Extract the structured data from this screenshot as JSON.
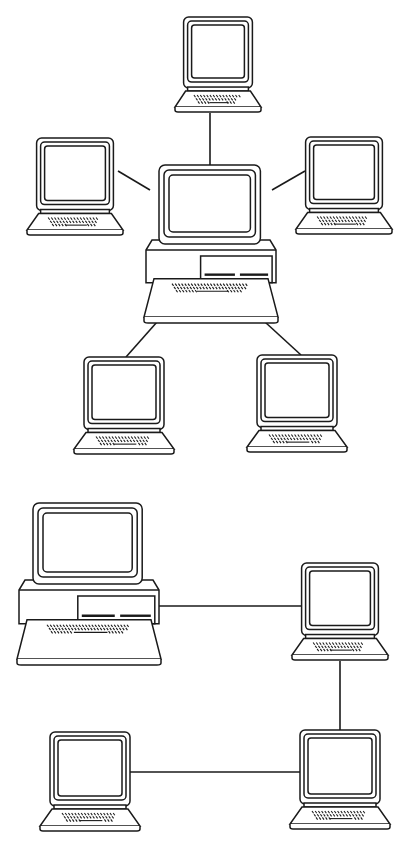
{
  "diagrams": [
    {
      "name": "star-topology",
      "hub": {
        "type": "desktop-with-base-unit",
        "x": 146,
        "y": 165,
        "w": 130,
        "h": 158
      },
      "nodes": [
        {
          "id": "top",
          "type": "terminal",
          "x": 175,
          "y": 17,
          "w": 86,
          "h": 96
        },
        {
          "id": "left",
          "type": "terminal",
          "x": 27,
          "y": 138,
          "w": 96,
          "h": 98
        },
        {
          "id": "right",
          "type": "terminal",
          "x": 296,
          "y": 137,
          "w": 96,
          "h": 98
        },
        {
          "id": "bottom-left",
          "type": "terminal",
          "x": 74,
          "y": 357,
          "w": 100,
          "h": 98
        },
        {
          "id": "bottom-right",
          "type": "terminal",
          "x": 247,
          "y": 355,
          "w": 100,
          "h": 98
        }
      ],
      "links": [
        {
          "from": "top",
          "to": "hub",
          "x1": 210,
          "y1": 113,
          "x2": 210,
          "y2": 165
        },
        {
          "from": "left",
          "to": "hub",
          "x1": 118,
          "y1": 171,
          "x2": 150,
          "y2": 190
        },
        {
          "from": "right",
          "to": "hub",
          "x1": 305,
          "y1": 171,
          "x2": 272,
          "y2": 190
        },
        {
          "from": "hub",
          "to": "bottom-left",
          "x1": 157,
          "y1": 322,
          "x2": 126,
          "y2": 357
        },
        {
          "from": "hub",
          "to": "bottom-right",
          "x1": 265,
          "y1": 322,
          "x2": 301,
          "y2": 355
        }
      ]
    },
    {
      "name": "chain-topology",
      "hub": {
        "type": "desktop-with-base-unit",
        "x": 19,
        "y": 503,
        "w": 140,
        "h": 162
      },
      "nodes": [
        {
          "id": "upper-right",
          "type": "terminal",
          "x": 292,
          "y": 563,
          "w": 96,
          "h": 98
        },
        {
          "id": "lower-right",
          "type": "terminal",
          "x": 290,
          "y": 730,
          "w": 100,
          "h": 100
        },
        {
          "id": "lower-left",
          "type": "terminal",
          "x": 40,
          "y": 732,
          "w": 100,
          "h": 100
        }
      ],
      "links": [
        {
          "from": "hub",
          "to": "upper-right",
          "x1": 157,
          "y1": 606,
          "x2": 303,
          "y2": 606
        },
        {
          "from": "upper-right",
          "to": "lower-right",
          "x1": 340,
          "y1": 661,
          "x2": 340,
          "y2": 730
        },
        {
          "from": "lower-left",
          "to": "lower-right",
          "x1": 130,
          "y1": 772,
          "x2": 300,
          "y2": 772
        }
      ]
    }
  ]
}
